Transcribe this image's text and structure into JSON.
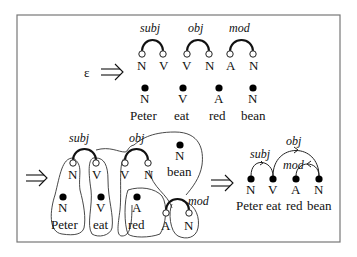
{
  "diagram": {
    "colors": {
      "stroke": "#111111",
      "frame": "#777777",
      "background": "#ffffff"
    },
    "top": {
      "start_symbol": "ε",
      "arrow": "⟹",
      "templates": [
        {
          "relation": "subj",
          "left": "N",
          "right": "V"
        },
        {
          "relation": "obj",
          "left": "V",
          "right": "N"
        },
        {
          "relation": "mod",
          "left": "A",
          "right": "N"
        }
      ],
      "words": [
        {
          "pos": "N",
          "word": "Peter"
        },
        {
          "pos": "V",
          "word": "eat"
        },
        {
          "pos": "A",
          "word": "red"
        },
        {
          "pos": "N",
          "word": "bean"
        }
      ]
    },
    "middle": {
      "arrow": "⟹",
      "relations": [
        "subj",
        "obj",
        "mod"
      ],
      "slots": [
        {
          "label": "N"
        },
        {
          "label": "V"
        },
        {
          "label": "V"
        },
        {
          "label": "N"
        },
        {
          "label": "A"
        },
        {
          "label": "N"
        }
      ],
      "words": [
        {
          "pos": "N",
          "word": "Peter"
        },
        {
          "pos": "V",
          "word": "eat"
        },
        {
          "pos": "A",
          "word": "red"
        },
        {
          "pos": "N",
          "word": "bean"
        }
      ]
    },
    "result": {
      "arrow": "⟹",
      "relations": [
        {
          "label": "subj",
          "from": "eat",
          "to": "Peter"
        },
        {
          "label": "obj",
          "from": "eat",
          "to": "bean"
        },
        {
          "label": "mod",
          "from": "bean",
          "to": "red"
        }
      ],
      "words": [
        {
          "pos": "N",
          "word": "Peter"
        },
        {
          "pos": "V",
          "word": "eat"
        },
        {
          "pos": "A",
          "word": "red"
        },
        {
          "pos": "N",
          "word": "bean"
        }
      ]
    }
  }
}
